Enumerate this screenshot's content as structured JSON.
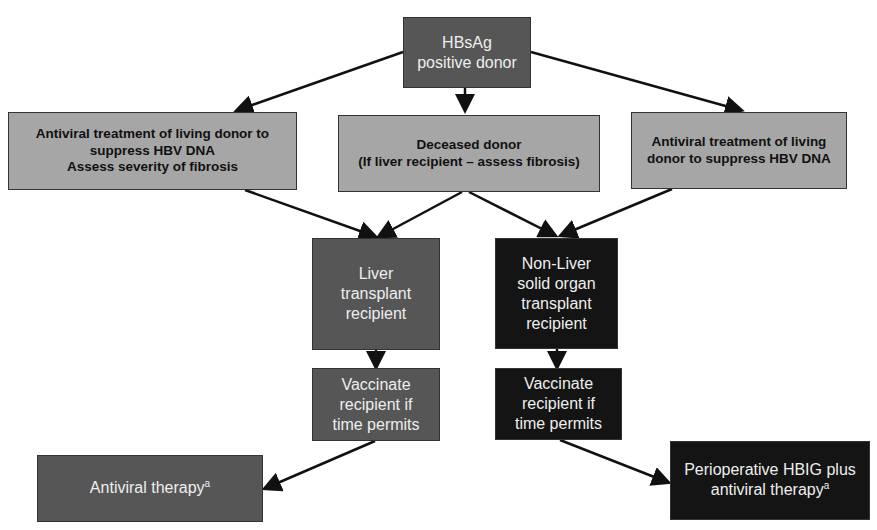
{
  "nodes": {
    "root": {
      "text": "HBsAg\npositive donor"
    },
    "left_donor": {
      "text": "Antiviral treatment of living donor to\nsuppress HBV DNA\nAssess severity of fibrosis"
    },
    "deceased": {
      "text": "Deceased donor\n(If liver recipient – assess fibrosis)"
    },
    "right_donor": {
      "text": "Antiviral treatment of living\ndonor to suppress HBV DNA"
    },
    "liver": {
      "text": "Liver\ntransplant\nrecipient"
    },
    "nonliver": {
      "text": "Non-Liver\nsolid organ\ntransplant\nrecipient"
    },
    "vacc_left": {
      "text": "Vaccinate\nrecipient if\ntime permits"
    },
    "vacc_right": {
      "text": "Vaccinate\nrecipient if\ntime permits"
    },
    "antiviral": {
      "text": "Antiviral therapy",
      "sup": "a"
    },
    "hbig": {
      "text": "Perioperative HBIG plus\nantiviral therapy",
      "sup": "a"
    }
  },
  "colors": {
    "light": "#a6a6a6",
    "mid": "#565656",
    "dark": "#141414"
  }
}
